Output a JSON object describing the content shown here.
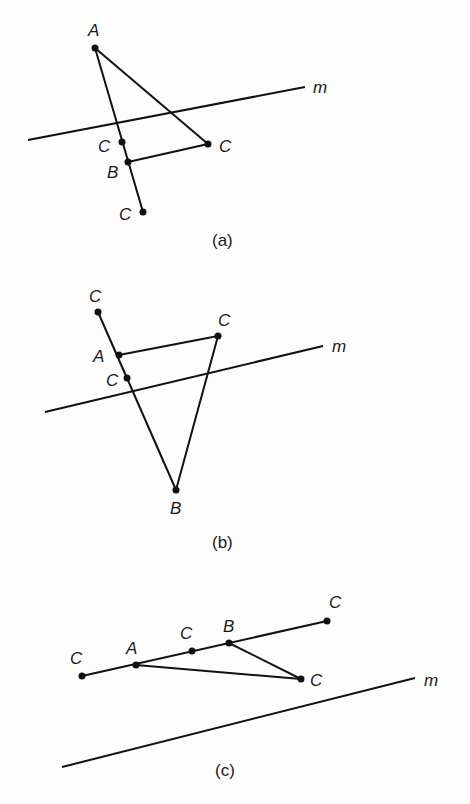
{
  "figures": [
    {
      "caption": "(a)",
      "line_label": "m",
      "labels": {
        "A": "A",
        "B": "B",
        "C1": "C",
        "C2": "C",
        "C3": "C"
      }
    },
    {
      "caption": "(b)",
      "line_label": "m",
      "labels": {
        "A": "A",
        "B": "B",
        "C1": "C",
        "C2": "C",
        "C3": "C"
      }
    },
    {
      "caption": "(c)",
      "line_label": "m",
      "labels": {
        "A": "A",
        "B": "B",
        "C1": "C",
        "C2": "C",
        "C3": "C",
        "C4": "C"
      }
    }
  ]
}
